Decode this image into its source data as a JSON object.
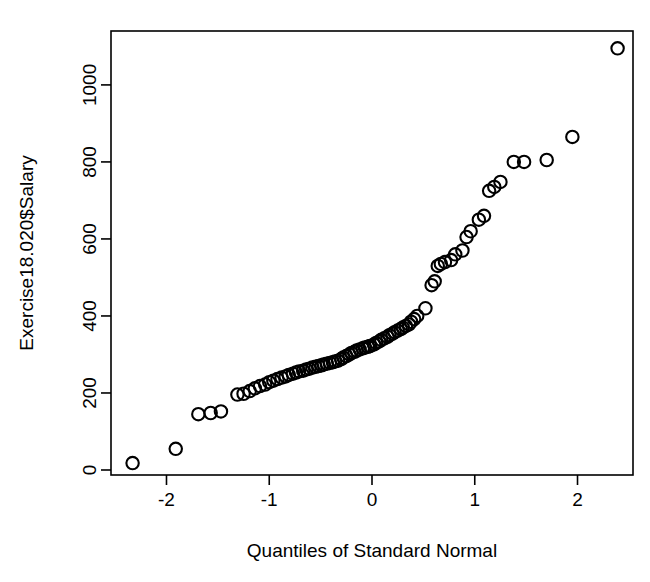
{
  "figure": {
    "background_color": "#ffffff",
    "ink_color": "#000000",
    "width": 650,
    "height": 582
  },
  "labels": {
    "xlabel": "Quantiles of Standard Normal",
    "ylabel": "Exercise18.020$Salary",
    "title": ""
  },
  "axes": {
    "x_ticks": [
      "-2",
      "-1",
      "0",
      "1",
      "2"
    ],
    "y_ticks": [
      "0",
      "200",
      "400",
      "600",
      "800",
      "1000"
    ],
    "x_tick_values": [
      -2,
      -1,
      0,
      1,
      2
    ],
    "y_tick_values": [
      0,
      200,
      400,
      600,
      800,
      1000
    ],
    "plot_box_px": {
      "left": 111,
      "top": 31,
      "right": 633,
      "bottom": 475
    },
    "x_px_per_unit": 103,
    "x_zero_px": 369,
    "y_px_per_200": 78,
    "y_zero_px": 458
  },
  "chart_data": {
    "type": "scatter",
    "title": "",
    "xlabel": "Quantiles of Standard Normal",
    "ylabel": "Exercise18.020$Salary",
    "xlim": [
      -2.54,
      2.54
    ],
    "ylim": [
      -13,
      1140
    ],
    "grid": false,
    "legend": "none",
    "marker": "open-circle",
    "marker_radius_px": 6.2,
    "series": [
      {
        "name": "Salary quantiles vs standard normal quantiles",
        "x": [
          -2.33,
          -1.91,
          -1.69,
          -1.57,
          -1.47,
          -1.31,
          -1.25,
          -1.19,
          -1.14,
          -1.09,
          -1.04,
          -1.0,
          -0.96,
          -0.92,
          -0.88,
          -0.84,
          -0.81,
          -0.77,
          -0.74,
          -0.71,
          -0.67,
          -0.64,
          -0.61,
          -0.58,
          -0.55,
          -0.52,
          -0.49,
          -0.47,
          -0.44,
          -0.41,
          -0.38,
          -0.36,
          -0.33,
          -0.3,
          -0.28,
          -0.25,
          -0.22,
          -0.2,
          -0.17,
          -0.15,
          -0.12,
          -0.09,
          -0.07,
          -0.04,
          -0.02,
          0.02,
          0.04,
          0.07,
          0.09,
          0.12,
          0.15,
          0.17,
          0.2,
          0.22,
          0.25,
          0.28,
          0.3,
          0.33,
          0.36,
          0.38,
          0.41,
          0.44,
          0.52,
          0.58,
          0.61,
          0.64,
          0.67,
          0.71,
          0.77,
          0.81,
          0.88,
          0.92,
          0.96,
          1.04,
          1.09,
          1.14,
          1.19,
          1.25,
          1.38,
          1.48,
          1.7,
          1.95,
          2.39
        ],
        "y": [
          18,
          55,
          145,
          148,
          152,
          196,
          198,
          205,
          212,
          218,
          222,
          228,
          232,
          236,
          240,
          243,
          247,
          250,
          253,
          256,
          258,
          261,
          263,
          266,
          268,
          270,
          272,
          274,
          276,
          278,
          280,
          282,
          284,
          288,
          292,
          296,
          300,
          304,
          307,
          310,
          313,
          316,
          318,
          320,
          322,
          326,
          330,
          334,
          338,
          342,
          346,
          350,
          354,
          358,
          362,
          366,
          370,
          374,
          378,
          385,
          392,
          400,
          420,
          480,
          490,
          530,
          535,
          540,
          545,
          560,
          570,
          605,
          620,
          650,
          660,
          725,
          735,
          748,
          800,
          800,
          805,
          865,
          1095
        ]
      }
    ]
  }
}
